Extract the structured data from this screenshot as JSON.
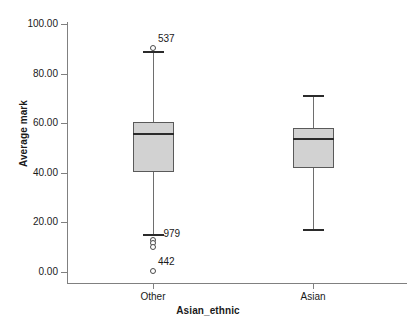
{
  "chart_data": {
    "type": "box",
    "title": "",
    "xlabel": "Asian_ethnic",
    "ylabel": "Average mark",
    "ylim": [
      0,
      100
    ],
    "yticks": [
      "0.00",
      "20.00",
      "40.00",
      "60.00",
      "80.00",
      "100.00"
    ],
    "ytick_values": [
      0,
      20,
      40,
      60,
      80,
      100
    ],
    "grid": false,
    "legend": "none",
    "categories": [
      "Other",
      "Asian"
    ],
    "boxes": [
      {
        "category": "Other",
        "whisker_low": 15.5,
        "q1": 40.5,
        "median": 56.0,
        "q3": 60.5,
        "whisker_high": 89.0,
        "outliers": [
          {
            "value": 90.5,
            "label": "537"
          },
          {
            "value": 13.0,
            "label": ""
          },
          {
            "value": 11.5,
            "label": ""
          },
          {
            "value": 10.0,
            "label": ""
          },
          {
            "value": 0.3,
            "label": "442"
          }
        ],
        "whisker_labels": [
          {
            "value": 15.5,
            "label": "979"
          }
        ]
      },
      {
        "category": "Asian",
        "whisker_low": 17.5,
        "q1": 42.0,
        "median": 54.0,
        "q3": 58.0,
        "whisker_high": 71.5,
        "outliers": [],
        "whisker_labels": []
      }
    ],
    "colors": {
      "box_fill": "#d2d2d2",
      "box_edge": "#5a5a5a",
      "median": "#2b2b2b",
      "whisker": "#6e6e6e",
      "axis": "#808080",
      "text": "#1a1a1a",
      "background": "#ffffff"
    }
  }
}
